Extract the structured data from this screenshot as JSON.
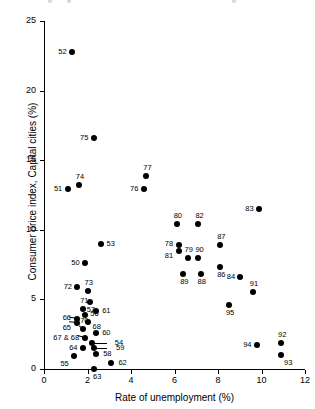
{
  "chart_data": {
    "type": "scatter",
    "title": "",
    "xlabel": "Rate of unemployment (%)",
    "ylabel": "Consumer price index, Capital cities (%)",
    "xlim": [
      0,
      12
    ],
    "ylim": [
      0,
      25
    ],
    "xticks": [
      "0",
      "2",
      "4",
      "6",
      "8",
      "10",
      "12"
    ],
    "xtick_values": [
      0,
      2,
      4,
      6,
      8,
      10,
      12
    ],
    "yticks": [
      "0",
      "5",
      "10",
      "15",
      "20",
      "25"
    ],
    "ytick_values": [
      0,
      5,
      10,
      15,
      20,
      25
    ],
    "grid": false,
    "legend": "none",
    "point_label_note": "Labels are two-digit years (1950-1994)",
    "points": [
      {
        "label": "52",
        "x": 1.3,
        "y": 22.8,
        "lx": -14,
        "ly": -4
      },
      {
        "label": "75",
        "x": 2.3,
        "y": 16.6,
        "lx": -14,
        "ly": -4
      },
      {
        "label": "51",
        "x": 1.1,
        "y": 12.9,
        "lx": -14,
        "ly": -4
      },
      {
        "label": "74",
        "x": 1.6,
        "y": 13.2,
        "lx": -3,
        "ly": -12
      },
      {
        "label": "77",
        "x": 4.7,
        "y": 13.9,
        "lx": -3,
        "ly": -12
      },
      {
        "label": "76",
        "x": 4.6,
        "y": 12.9,
        "lx": -14,
        "ly": -4
      },
      {
        "label": "83",
        "x": 9.9,
        "y": 11.5,
        "lx": -14,
        "ly": -4
      },
      {
        "label": "80",
        "x": 6.1,
        "y": 10.4,
        "lx": -3,
        "ly": -12
      },
      {
        "label": "82",
        "x": 7.1,
        "y": 10.4,
        "lx": -3,
        "ly": -12
      },
      {
        "label": "53",
        "x": 2.6,
        "y": 9.0,
        "lx": 6,
        "ly": -4
      },
      {
        "label": "78",
        "x": 6.2,
        "y": 8.9,
        "lx": -14,
        "ly": -5
      },
      {
        "label": "81",
        "x": 6.2,
        "y": 8.5,
        "lx": -14,
        "ly": 1
      },
      {
        "label": "87",
        "x": 8.1,
        "y": 8.9,
        "lx": -3,
        "ly": -12
      },
      {
        "label": "79",
        "x": 6.6,
        "y": 8.0,
        "lx": -3,
        "ly": -12
      },
      {
        "label": "90",
        "x": 7.1,
        "y": 8.0,
        "lx": -3,
        "ly": -12
      },
      {
        "label": "50",
        "x": 1.9,
        "y": 7.6,
        "lx": -14,
        "ly": -4
      },
      {
        "label": "86",
        "x": 8.1,
        "y": 7.3,
        "lx": -3,
        "ly": 4
      },
      {
        "label": "89",
        "x": 6.4,
        "y": 6.8,
        "lx": -3,
        "ly": 4
      },
      {
        "label": "88",
        "x": 7.2,
        "y": 6.8,
        "lx": -3,
        "ly": 4
      },
      {
        "label": "84",
        "x": 9.0,
        "y": 6.6,
        "lx": -13,
        "ly": -4
      },
      {
        "label": "72",
        "x": 1.5,
        "y": 5.9,
        "lx": -13,
        "ly": -4
      },
      {
        "label": "73",
        "x": 2.0,
        "y": 5.6,
        "lx": -3,
        "ly": -12
      },
      {
        "label": "91",
        "x": 9.6,
        "y": 5.5,
        "lx": -3,
        "ly": -12
      },
      {
        "label": "57",
        "x": 2.1,
        "y": 4.8,
        "lx": -3,
        "ly": 4
      },
      {
        "label": "95",
        "x": 8.5,
        "y": 4.6,
        "lx": -3,
        "ly": 4
      },
      {
        "label": "71",
        "x": 1.8,
        "y": 4.3,
        "lx": -3,
        "ly": -12
      },
      {
        "label": "61",
        "x": 2.4,
        "y": 4.2,
        "lx": 6,
        "ly": -4
      },
      {
        "label": "56",
        "x": 1.9,
        "y": 3.9,
        "lx": 5,
        "ly": -5
      },
      {
        "label": "66",
        "x": 1.5,
        "y": 3.6,
        "lx": -14,
        "ly": -5
      },
      {
        "label": "65",
        "x": 1.5,
        "y": 3.3,
        "lx": -14,
        "ly": 1
      },
      {
        "label": "68",
        "x": 2.0,
        "y": 3.4,
        "lx": 5,
        "ly": 1
      },
      {
        "label": "70",
        "x": 1.8,
        "y": 2.9,
        "lx": -3,
        "ly": -12
      },
      {
        "label": "60",
        "x": 2.4,
        "y": 2.6,
        "lx": 6,
        "ly": -4
      },
      {
        "label": "67 & 68",
        "x": 1.9,
        "y": 2.2,
        "lx": -32,
        "ly": -4
      },
      {
        "label": "54",
        "x": 2.2,
        "y": 1.9,
        "lx": 23,
        "ly": -4
      },
      {
        "label": "59",
        "x": 2.3,
        "y": 1.5,
        "lx": 22,
        "ly": -4
      },
      {
        "label": "64",
        "x": 1.8,
        "y": 1.5,
        "lx": -14,
        "ly": -4
      },
      {
        "label": "58",
        "x": 2.4,
        "y": 1.1,
        "lx": 7,
        "ly": -4
      },
      {
        "label": "92",
        "x": 10.9,
        "y": 1.9,
        "lx": -3,
        "ly": -12
      },
      {
        "label": "94",
        "x": 9.8,
        "y": 1.7,
        "lx": -14,
        "ly": -4
      },
      {
        "label": "93",
        "x": 10.9,
        "y": 1.0,
        "lx": 3,
        "ly": 4
      },
      {
        "label": "55",
        "x": 1.4,
        "y": 0.9,
        "lx": -14,
        "ly": 4
      },
      {
        "label": "62",
        "x": 3.1,
        "y": 0.4,
        "lx": 7,
        "ly": -4
      },
      {
        "label": "63",
        "x": 2.3,
        "y": 0.0,
        "lx": -1,
        "ly": 4
      }
    ],
    "leaders": [
      {
        "from_label": "54",
        "x1": 2.2,
        "y1": 1.9,
        "x2": 2.9,
        "y2": 1.9
      },
      {
        "from_label": "59",
        "x1": 2.3,
        "y1": 1.5,
        "x2": 2.9,
        "y2": 1.5
      },
      {
        "from_label": "67 & 68",
        "x1": 1.9,
        "y1": 2.2,
        "x2": 1.55,
        "y2": 2.35
      },
      {
        "from_label": "66",
        "x1": 1.5,
        "y1": 3.6,
        "x2": 1.15,
        "y2": 3.7
      },
      {
        "from_label": "65",
        "x1": 1.5,
        "y1": 3.3,
        "x2": 1.15,
        "y2": 3.35
      },
      {
        "from_label": "70",
        "x1": 1.8,
        "y1": 2.9,
        "x2": 1.6,
        "y2": 3.1
      }
    ]
  }
}
